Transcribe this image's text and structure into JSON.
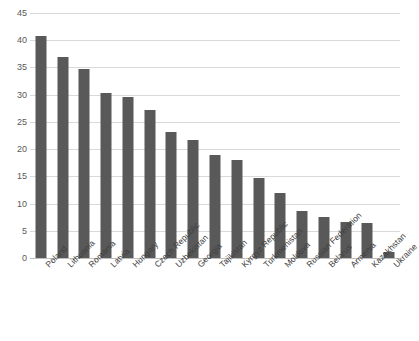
{
  "chart_data": {
    "type": "bar",
    "title": "",
    "xlabel": "",
    "ylabel": "",
    "ylim": [
      0,
      45
    ],
    "yticks": [
      0,
      5,
      10,
      15,
      20,
      25,
      30,
      35,
      40,
      45
    ],
    "grid": true,
    "legend": false,
    "bar_color": "#595959",
    "gridline_color": "#d9d9d9",
    "axis_color": "#bfbfbf",
    "categories": [
      "Poland",
      "Lithuania",
      "Romania",
      "Latvia",
      "Hungary",
      "Czech Republic",
      "Uzbekistan",
      "Georgia",
      "Tajikistan",
      "Kyrgyz Republic",
      "Turkmenistan",
      "Moldova",
      "Russian Federation",
      "Belarus",
      "Armenia",
      "Kazakhstan",
      "Ukraine"
    ],
    "values": [
      40.7,
      37.0,
      34.7,
      30.3,
      29.6,
      27.2,
      23.2,
      21.7,
      19.0,
      18.0,
      14.7,
      11.9,
      8.6,
      7.5,
      6.7,
      6.4,
      1.1
    ]
  }
}
